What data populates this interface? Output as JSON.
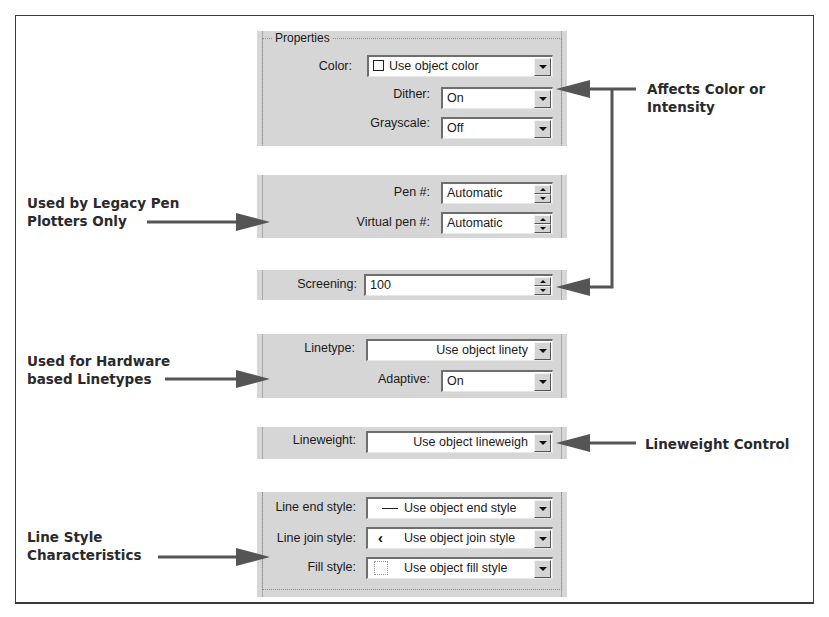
{
  "properties_group": {
    "title": "Properties",
    "color": {
      "label": "Color:",
      "value": "Use object color",
      "icon": "white-square-swatch-icon"
    },
    "dither": {
      "label": "Dither:",
      "value": "On"
    },
    "grayscale": {
      "label": "Grayscale:",
      "value": "Off"
    }
  },
  "pen": {
    "pen_number": {
      "label": "Pen #:",
      "value": "Automatic"
    },
    "virtual_pen_number": {
      "label": "Virtual pen #:",
      "value": "Automatic"
    }
  },
  "screening": {
    "label": "Screening:",
    "value": "100"
  },
  "linetype": {
    "linetype": {
      "label": "Linetype:",
      "value": "Use object linety"
    },
    "adaptive": {
      "label": "Adaptive:",
      "value": "On"
    }
  },
  "lineweight": {
    "label": "Lineweight:",
    "value": "Use object lineweigh"
  },
  "line_style": {
    "end_style": {
      "label": "Line end style:",
      "value": "Use object end style",
      "icon": "line-end-icon"
    },
    "join_style": {
      "label": "Line join style:",
      "value": "Use object join style",
      "icon": "line-join-icon"
    },
    "fill_style": {
      "label": "Fill style:",
      "value": "Use object fill style",
      "icon": "fill-swatch-icon"
    }
  },
  "annotations": {
    "color_intensity": [
      "Affects Color or",
      "Intensity"
    ],
    "legacy_pen": [
      "Used by Legacy Pen",
      "Plotters Only"
    ],
    "hardware_linetypes": [
      "Used for Hardware",
      "based Linetypes"
    ],
    "lineweight_control": [
      "Lineweight Control"
    ],
    "line_style": [
      "Line Style",
      "Characteristics"
    ]
  },
  "colors": {
    "panel_bg": "#d6d6d6",
    "arrow": "#555555",
    "annotation_text": "#2a2a2a"
  }
}
